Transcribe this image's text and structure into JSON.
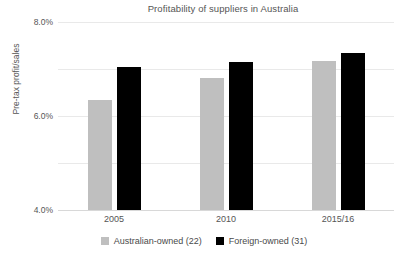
{
  "chart_data": {
    "type": "bar",
    "title": "Profitability of suppliers in Australia",
    "xlabel": "",
    "ylabel": "Pre-tax profit/sales",
    "categories": [
      "2005",
      "2010",
      "2015/16"
    ],
    "series": [
      {
        "name": "Australian-owned (22)",
        "color": "#bfbfbf",
        "values": [
          4.7,
          5.6,
          6.35
        ]
      },
      {
        "name": "Foreign-owned (31)",
        "color": "#000000",
        "values": [
          6.1,
          6.3,
          6.7
        ]
      }
    ],
    "ylim": [
      0.0,
      8.0
    ],
    "yticks": [
      0.0,
      2.0,
      4.0,
      6.0,
      8.0
    ],
    "ytick_labels": [
      "0.0%",
      "2.0%",
      "4.0%",
      "6.0%",
      "8.0%"
    ],
    "grid": true,
    "legend_position": "bottom"
  },
  "legend": {
    "entries": [
      {
        "label": "Australian-owned (22)",
        "color": "#bfbfbf"
      },
      {
        "label": "Foreign-owned (31)",
        "color": "#000000"
      }
    ]
  }
}
